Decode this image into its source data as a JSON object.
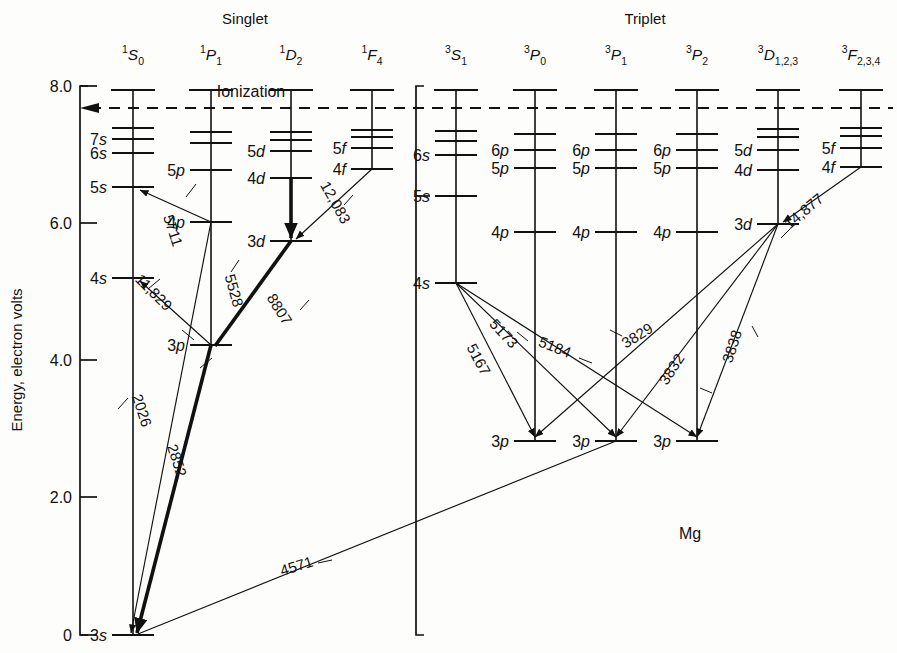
{
  "figure": {
    "element_label": "Mg",
    "ionization_label": "Ionization",
    "group_singlet": "Singlet",
    "group_triplet": "Triplet",
    "y_axis_label": "Energy, electron volts"
  },
  "axis": {
    "ticks": [
      "8.0",
      "6.0",
      "4.0",
      "2.0",
      "0"
    ],
    "tick_values": [
      8.0,
      6.0,
      4.0,
      2.0,
      0
    ],
    "ymin": 0,
    "ymax": 8.0,
    "units": "eV"
  },
  "columns": [
    {
      "id": "1S0",
      "term_n": "1",
      "term_letter": "S",
      "term_j": "0",
      "group": "Singlet",
      "x": 133,
      "levels": [
        {
          "label": "3s",
          "y": 635
        },
        {
          "label": "4s",
          "y": 278
        },
        {
          "label": "5s",
          "y": 187
        },
        {
          "label": "6s",
          "y": 153
        },
        {
          "label": "7s",
          "y": 139
        },
        {
          "label": "",
          "y": 128
        }
      ]
    },
    {
      "id": "1P1",
      "term_n": "1",
      "term_letter": "P",
      "term_j": "1",
      "group": "Singlet",
      "x": 211,
      "levels": [
        {
          "label": "3p",
          "y": 345
        },
        {
          "label": "4p",
          "y": 222
        },
        {
          "label": "5p",
          "y": 170
        },
        {
          "label": "",
          "y": 143
        },
        {
          "label": "",
          "y": 132
        }
      ]
    },
    {
      "id": "1D2",
      "term_n": "1",
      "term_letter": "D",
      "term_j": "2",
      "group": "Singlet",
      "x": 291,
      "levels": [
        {
          "label": "3d",
          "y": 241
        },
        {
          "label": "4d",
          "y": 178
        },
        {
          "label": "5d",
          "y": 151
        },
        {
          "label": "",
          "y": 140
        },
        {
          "label": "",
          "y": 132
        }
      ]
    },
    {
      "id": "1F4",
      "term_n": "1",
      "term_letter": "F",
      "term_j": "4",
      "group": "Singlet",
      "x": 372,
      "levels": [
        {
          "label": "4f",
          "y": 169
        },
        {
          "label": "5f",
          "y": 148
        },
        {
          "label": "",
          "y": 137
        },
        {
          "label": "",
          "y": 130
        }
      ]
    },
    {
      "id": "3S1",
      "term_n": "3",
      "term_letter": "S",
      "term_j": "1",
      "group": "Triplet",
      "x": 456,
      "levels": [
        {
          "label": "4s",
          "y": 283
        },
        {
          "label": "5s",
          "y": 196
        },
        {
          "label": "6s",
          "y": 155
        },
        {
          "label": "",
          "y": 141
        },
        {
          "label": "",
          "y": 131
        }
      ]
    },
    {
      "id": "3P0",
      "term_n": "3",
      "term_letter": "P",
      "term_j": "0",
      "group": "Triplet",
      "x": 535,
      "levels": [
        {
          "label": "3p",
          "y": 441
        },
        {
          "label": "4p",
          "y": 232
        },
        {
          "label": "5p",
          "y": 168
        },
        {
          "label": "6p",
          "y": 150
        },
        {
          "label": "",
          "y": 134
        }
      ]
    },
    {
      "id": "3P1",
      "term_n": "3",
      "term_letter": "P",
      "term_j": "1",
      "group": "Triplet",
      "x": 616,
      "levels": [
        {
          "label": "3p",
          "y": 441
        },
        {
          "label": "4p",
          "y": 232
        },
        {
          "label": "5p",
          "y": 168
        },
        {
          "label": "6p",
          "y": 150
        },
        {
          "label": "",
          "y": 134
        }
      ]
    },
    {
      "id": "3P2",
      "term_n": "3",
      "term_letter": "P",
      "term_j": "2",
      "group": "Triplet",
      "x": 697,
      "levels": [
        {
          "label": "3p",
          "y": 441
        },
        {
          "label": "4p",
          "y": 232
        },
        {
          "label": "5p",
          "y": 168
        },
        {
          "label": "6p",
          "y": 150
        },
        {
          "label": "",
          "y": 134
        }
      ]
    },
    {
      "id": "3D123",
      "term_n": "3",
      "term_letter": "D",
      "term_j": "1,2,3",
      "group": "Triplet",
      "x": 778,
      "levels": [
        {
          "label": "3d",
          "y": 224
        },
        {
          "label": "4d",
          "y": 170
        },
        {
          "label": "5d",
          "y": 150
        },
        {
          "label": "",
          "y": 137
        },
        {
          "label": "",
          "y": 129
        }
      ]
    },
    {
      "id": "3F234",
      "term_n": "3",
      "term_letter": "F",
      "term_j": "2,3,4",
      "group": "Triplet",
      "x": 861,
      "levels": [
        {
          "label": "4f",
          "y": 167
        },
        {
          "label": "5f",
          "y": 148
        },
        {
          "label": "",
          "y": 136
        },
        {
          "label": "",
          "y": 128
        }
      ]
    }
  ],
  "transitions": [
    {
      "label": "5711",
      "from": "1P1 4p",
      "to": "1S0 5s",
      "weight": "thin"
    },
    {
      "label": "11,829",
      "from": "1P1 3p",
      "to": "1S0 4s",
      "weight": "thin"
    },
    {
      "label": "2026",
      "from": "1P1 4p",
      "to": "1S0 3s",
      "weight": "thin"
    },
    {
      "label": "2852",
      "from": "1P1 3p",
      "to": "1S0 3s",
      "weight": "bold"
    },
    {
      "label": "5528",
      "from": "1D2 3d",
      "to": "1P1 3p",
      "weight": "bold"
    },
    {
      "label": "8807",
      "from": "1D2 3d",
      "to": "1P1 3p",
      "weight": "thin"
    },
    {
      "label": "12,083",
      "from": "1F4 4f",
      "to": "1D2 3d",
      "weight": "thin"
    },
    {
      "label": "5167",
      "from": "3S1 4s",
      "to": "3P0 3p",
      "weight": "thin"
    },
    {
      "label": "5173",
      "from": "3S1 4s",
      "to": "3P1 3p",
      "weight": "thin"
    },
    {
      "label": "5184",
      "from": "3S1 4s",
      "to": "3P2 3p",
      "weight": "thin"
    },
    {
      "label": "3829",
      "from": "3D123 3d",
      "to": "3P0 3p",
      "weight": "thin"
    },
    {
      "label": "3832",
      "from": "3D123 3d",
      "to": "3P1 3p",
      "weight": "thin"
    },
    {
      "label": "3838",
      "from": "3D123 3d",
      "to": "3P2 3p",
      "weight": "thin"
    },
    {
      "label": "14,877",
      "from": "3F234 4f",
      "to": "3D123 3d",
      "weight": "thin"
    },
    {
      "label": "4571",
      "from": "3P1 3p",
      "to": "1S0 3s",
      "weight": "thin"
    }
  ],
  "wavelength_labels": [
    {
      "text": "5711",
      "x": 168,
      "y": 232,
      "rot": 72
    },
    {
      "text": "11,829",
      "x": 150,
      "y": 296,
      "rot": 45
    },
    {
      "text": "2026",
      "x": 137,
      "y": 412,
      "rot": 72
    },
    {
      "text": "2852",
      "x": 172,
      "y": 462,
      "rot": 72
    },
    {
      "text": "5528",
      "x": 229,
      "y": 292,
      "rot": 74
    },
    {
      "text": "8807",
      "x": 275,
      "y": 312,
      "rot": 58
    },
    {
      "text": "12,083",
      "x": 331,
      "y": 205,
      "rot": 61
    },
    {
      "text": "5167",
      "x": 474,
      "y": 362,
      "rot": 62
    },
    {
      "text": "5173",
      "x": 500,
      "y": 337,
      "rot": 47
    },
    {
      "text": "5184",
      "x": 553,
      "y": 352,
      "rot": 22
    },
    {
      "text": "3829",
      "x": 640,
      "y": 340,
      "rot": -32
    },
    {
      "text": "3832",
      "x": 676,
      "y": 372,
      "rot": -57
    },
    {
      "text": "3838",
      "x": 737,
      "y": 348,
      "rot": -72
    },
    {
      "text": "14,877",
      "x": 807,
      "y": 215,
      "rot": -40
    },
    {
      "text": "4571",
      "x": 298,
      "y": 571,
      "rot": -17
    }
  ]
}
